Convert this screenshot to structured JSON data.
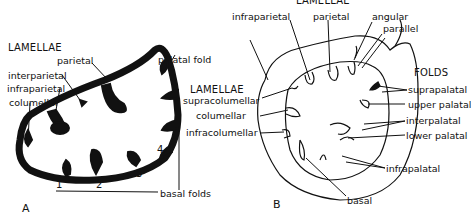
{
  "figure_a": {
    "panel_label": "A",
    "lamellae_header": "LAMELLAE",
    "labels": {
      "parietal": "parietal",
      "interparietal": "interparietal",
      "infraparietal": "infraparietal",
      "columellar": "columellar",
      "palatal_fold": "palatal fold",
      "basal_folds": "basal folds"
    },
    "fold_numbers": [
      "1",
      "2",
      "3",
      "4",
      "5"
    ]
  },
  "figure_b": {
    "panel_label": "B",
    "lamellae_top_header": "LAMELLAE",
    "lamellae_left_header": "LAMELLAE",
    "folds_header": "FOLDS",
    "labels": {
      "infraparietal": "infraparietal",
      "parietal": "parietal",
      "angular": "angular",
      "parallel": "parallel",
      "supracolumellar": "supracolumellar",
      "columellar": "columellar",
      "infracolumellar": "infracolumellar",
      "suprapalatal": "suprapalatal",
      "upper_palatal": "upper palatal",
      "interpalatal": "interpalatal",
      "lower_palatal": "lower palatal",
      "infrapalatal": "infrapalatal",
      "basal": "basal"
    }
  },
  "colors": {
    "ink": "#111111",
    "background": "#ffffff"
  }
}
